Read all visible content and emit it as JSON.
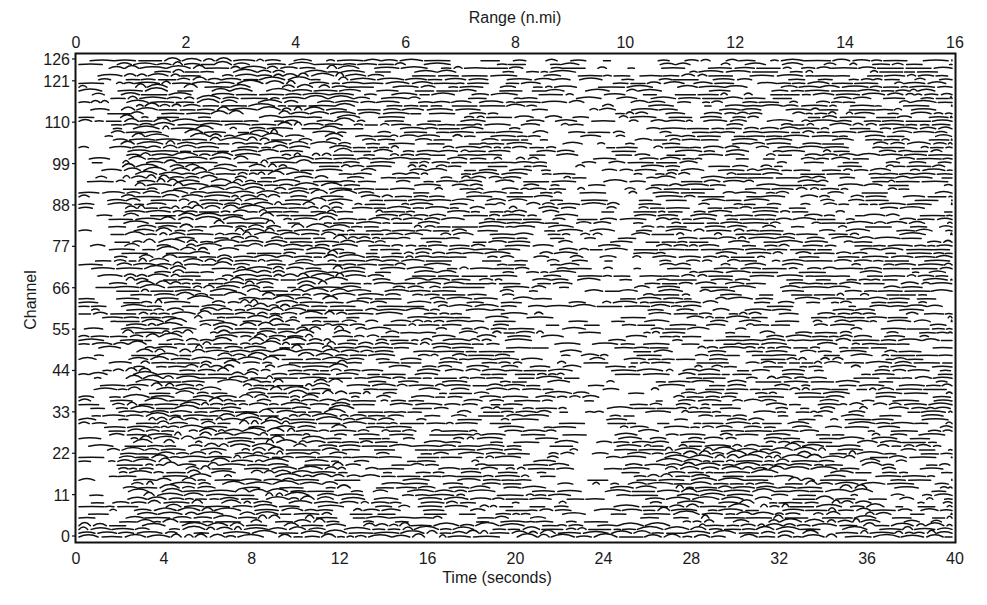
{
  "chart_data": {
    "type": "heatmap",
    "subtype": "seismic-wiggle-trace",
    "title": "",
    "top_axis": {
      "label": "Range (n.mi)",
      "ticks": [
        0,
        2,
        4,
        6,
        8,
        10,
        12,
        14,
        16
      ],
      "range": [
        0,
        16
      ]
    },
    "x_axis": {
      "label": "Time  (seconds)",
      "ticks": [
        0,
        4,
        8,
        12,
        16,
        20,
        24,
        28,
        32,
        36,
        40
      ],
      "range": [
        0,
        40
      ]
    },
    "y_axis": {
      "label": "Channel",
      "ticks": [
        0,
        11,
        22,
        33,
        44,
        55,
        66,
        77,
        88,
        99,
        110,
        121,
        126
      ],
      "range": [
        0,
        126
      ]
    },
    "grid": false,
    "legend": null,
    "num_channels": 127,
    "colors": {
      "trace": "#111111",
      "background": "#ffffff",
      "frame": "#111111"
    },
    "features": [
      {
        "description": "dense coherent arrivals",
        "time_range": [
          2,
          12
        ],
        "channel_range": [
          0,
          126
        ]
      },
      {
        "description": "bright gap/white patch",
        "time_range": [
          4.8,
          5.4
        ],
        "channel_range": [
          56,
          62
        ]
      },
      {
        "description": "sparse low-amplitude band",
        "time_range": [
          22,
          25
        ],
        "channel_range": [
          0,
          126
        ]
      },
      {
        "description": "strong bottom-channel arrival",
        "time_range": [
          1,
          40
        ],
        "channel_range": [
          0,
          4
        ]
      }
    ]
  }
}
